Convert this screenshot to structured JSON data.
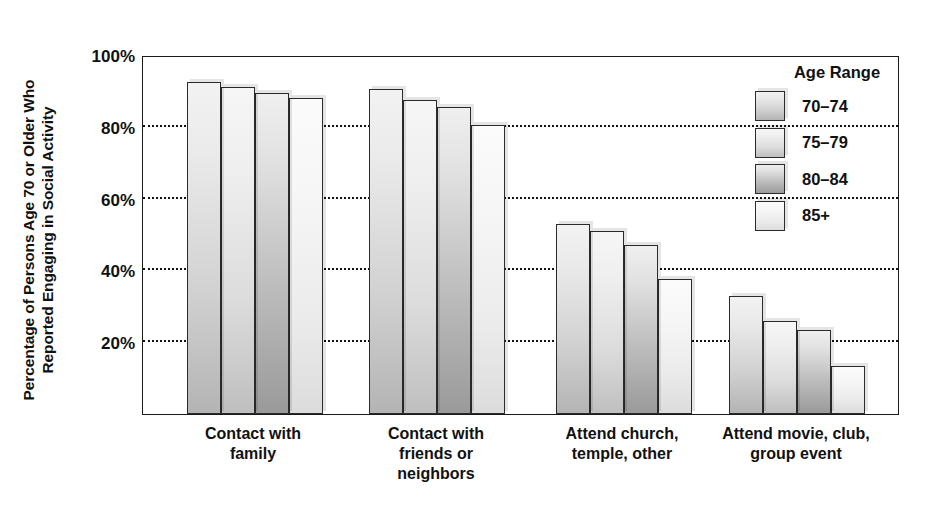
{
  "chart_data": {
    "type": "bar",
    "title": "",
    "xlabel": "",
    "ylabel": "Percentage of Persons Age 70 or Older Who Reported Engaging in Social Activity",
    "ylabel_line1": "Percentage of Persons Age 70 or Older Who",
    "ylabel_line2": "Reported Engaging in Social Activity",
    "ylim": [
      0,
      100
    ],
    "yticks": [
      "20%",
      "40%",
      "60%",
      "80%",
      "100%"
    ],
    "ytick_values": [
      20,
      40,
      60,
      80,
      100
    ],
    "grid": true,
    "grid_style": "dotted-horizontal",
    "legend_position": "top-right",
    "legend_title": "Age Range",
    "categories": [
      "Contact with family",
      "Contact with friends or neighbors",
      "Attend church, temple, other",
      "Attend movie, club, group event"
    ],
    "category_lines": [
      [
        "Contact with",
        "family"
      ],
      [
        "Contact with",
        "friends or",
        "neighbors"
      ],
      [
        "Attend church,",
        "temple, other"
      ],
      [
        "Attend movie, club,",
        "group event"
      ]
    ],
    "series": [
      {
        "name": "70–74",
        "values": [
          92.5,
          90.5,
          53,
          33
        ]
      },
      {
        "name": "75–79",
        "values": [
          91,
          87.5,
          51,
          26
        ]
      },
      {
        "name": "80–84",
        "values": [
          89.5,
          85.5,
          47,
          23.5
        ]
      },
      {
        "name": "85+",
        "values": [
          88,
          80.5,
          37.5,
          13.5
        ]
      }
    ]
  },
  "colors": {
    "axis": "#1a1a1a",
    "grid": "#111111",
    "text": "#111111",
    "background": "#ffffff",
    "series_70_74": "#d2d2d2",
    "series_75_79": "#dcdcdc",
    "series_80_84": "#bdbdbd",
    "series_85_plus": "#ebebeb"
  }
}
